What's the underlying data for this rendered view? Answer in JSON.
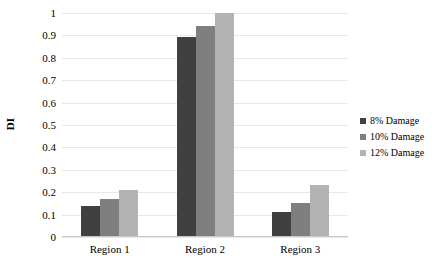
{
  "chart_data": {
    "type": "bar",
    "title": "",
    "subtitle": "",
    "xlabel": "",
    "ylabel": "DI",
    "categories": [
      "Region 1",
      "Region 2",
      "Region 3"
    ],
    "series": [
      {
        "name": "8% Damage",
        "values": [
          0.14,
          0.895,
          0.11
        ],
        "color": "#404040"
      },
      {
        "name": "10% Damage",
        "values": [
          0.17,
          0.94,
          0.15
        ],
        "color": "#7f7f7f"
      },
      {
        "name": "12% Damage",
        "values": [
          0.21,
          1.0,
          0.23
        ],
        "color": "#b3b3b3"
      }
    ],
    "ylim": [
      0,
      1
    ],
    "ytick_labels": [
      "0",
      "0.1",
      "0.2",
      "0.3",
      "0.4",
      "0.5",
      "0.6",
      "0.7",
      "0.8",
      "0.9",
      "1"
    ],
    "ytick_values": [
      0,
      0.1,
      0.2,
      0.3,
      0.4,
      0.5,
      0.6,
      0.7,
      0.8,
      0.9,
      1
    ],
    "grid": true,
    "grid_color": "#e8e8e8",
    "legend_position": "right",
    "background": "#ffffff"
  }
}
